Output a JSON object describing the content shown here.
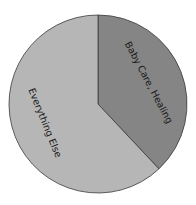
{
  "chart_data": {
    "type": "pie",
    "title": "",
    "categories": [
      "Baby Care, Healing",
      "Everything Else"
    ],
    "values": [
      38,
      62
    ],
    "colors": [
      "#858585",
      "#b6b6b6"
    ],
    "start_angle_deg": 0,
    "direction": "clockwise",
    "legend": "none",
    "labels_inside_slices": true
  },
  "labels": {
    "slice0": "Baby Care, Healing",
    "slice1": "Everything Else"
  }
}
